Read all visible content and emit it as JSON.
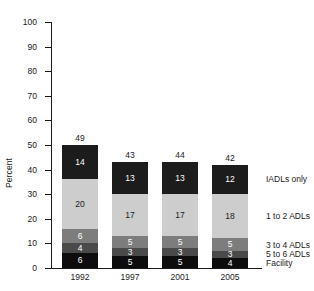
{
  "chart_data": {
    "type": "bar",
    "title": "",
    "subtitle": "",
    "xlabel": "",
    "ylabel": "Percent",
    "ylim": [
      0,
      100
    ],
    "ytick_labels": [
      "100",
      "90",
      "80",
      "70",
      "60",
      "50",
      "40",
      "30",
      "20",
      "10",
      "0"
    ],
    "ytick_values": [
      100,
      90,
      80,
      70,
      60,
      50,
      40,
      30,
      20,
      10,
      0
    ],
    "grid": false,
    "stacked": true,
    "legend_position": "right",
    "categories": [
      "1992",
      "1997",
      "2001",
      "2005"
    ],
    "totals": [
      49,
      43,
      44,
      42
    ],
    "series": [
      {
        "name": "Facility",
        "color": "#0d0d0d",
        "text_color": "#ffffff",
        "values": [
          6,
          5,
          5,
          4
        ]
      },
      {
        "name": "5 to 6 ADLs",
        "color": "#4a4a4a",
        "text_color": "#ffffff",
        "values": [
          4,
          3,
          3,
          3
        ]
      },
      {
        "name": "3 to 4 ADLs",
        "color": "#7d7d7d",
        "text_color": "#ffffff",
        "values": [
          6,
          5,
          5,
          5
        ]
      },
      {
        "name": "1 to 2 ADLs",
        "color": "#cdcdcd",
        "text_color": "#1a1a1a",
        "values": [
          20,
          17,
          17,
          18
        ]
      },
      {
        "name": "IADLs only",
        "color": "#1c1c1c",
        "text_color": "#ffffff",
        "values": [
          14,
          13,
          13,
          12
        ]
      }
    ],
    "legend_entries": [
      "IADLs only",
      "1 to 2 ADLs",
      "3 to 4 ADLs",
      "5 to 6 ADLs",
      "Facility"
    ]
  }
}
